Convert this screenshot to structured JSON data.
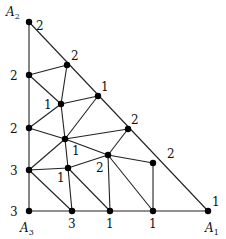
{
  "diagram": {
    "type": "triangulation with Sperner labeling",
    "corners": [
      {
        "name": "A",
        "sub": "2",
        "x": 6,
        "y": 16
      },
      {
        "name": "A",
        "sub": "3",
        "x": 20,
        "y": 232
      },
      {
        "name": "A",
        "sub": "1",
        "x": 205,
        "y": 232
      }
    ],
    "vertices": [
      {
        "x": 29,
        "y": 22,
        "label": "2",
        "lx": 36,
        "ly": 30
      },
      {
        "x": 67,
        "y": 65,
        "label": "2",
        "lx": 71,
        "ly": 60
      },
      {
        "x": 29,
        "y": 75,
        "label": "2",
        "lx": 10,
        "ly": 80
      },
      {
        "x": 61,
        "y": 104,
        "label": "1",
        "lx": 44,
        "ly": 109
      },
      {
        "x": 98,
        "y": 96,
        "label": "1",
        "lx": 101,
        "ly": 91
      },
      {
        "x": 29,
        "y": 128,
        "label": "2",
        "lx": 10,
        "ly": 133
      },
      {
        "x": 65,
        "y": 139,
        "label": "1",
        "lx": 72,
        "ly": 155
      },
      {
        "x": 128,
        "y": 129,
        "label": "2",
        "lx": 131,
        "ly": 124
      },
      {
        "x": 29,
        "y": 170,
        "label": "3",
        "lx": 10,
        "ly": 175
      },
      {
        "x": 68,
        "y": 168,
        "label": "1",
        "lx": 57,
        "ly": 182
      },
      {
        "x": 108,
        "y": 155,
        "label": "2",
        "lx": 96,
        "ly": 172
      },
      {
        "x": 153,
        "y": 163,
        "label": "2",
        "lx": 167,
        "ly": 158
      },
      {
        "x": 29,
        "y": 211,
        "label": "3",
        "lx": 10,
        "ly": 216
      },
      {
        "x": 72,
        "y": 211,
        "label": "3",
        "lx": 68,
        "ly": 228
      },
      {
        "x": 110,
        "y": 211,
        "label": "1",
        "lx": 106,
        "ly": 228
      },
      {
        "x": 153,
        "y": 211,
        "label": "1",
        "lx": 149,
        "ly": 228
      },
      {
        "x": 208,
        "y": 211,
        "label": "1",
        "lx": 212,
        "ly": 206
      }
    ],
    "edges": [
      [
        0,
        12
      ],
      [
        12,
        16
      ],
      [
        0,
        16
      ],
      [
        2,
        1
      ],
      [
        2,
        3
      ],
      [
        1,
        3
      ],
      [
        3,
        4
      ],
      [
        3,
        5
      ],
      [
        3,
        6
      ],
      [
        4,
        6
      ],
      [
        5,
        6
      ],
      [
        6,
        7
      ],
      [
        6,
        10
      ],
      [
        6,
        8
      ],
      [
        6,
        9
      ],
      [
        7,
        10
      ],
      [
        10,
        11
      ],
      [
        10,
        9
      ],
      [
        10,
        14
      ],
      [
        10,
        15
      ],
      [
        8,
        9
      ],
      [
        8,
        13
      ],
      [
        9,
        13
      ],
      [
        9,
        14
      ],
      [
        11,
        15
      ]
    ]
  }
}
